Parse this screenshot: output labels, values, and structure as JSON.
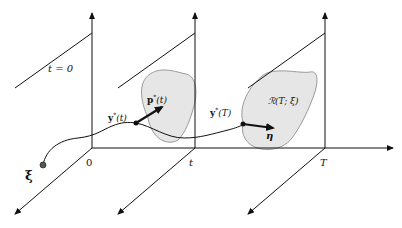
{
  "diagram": {
    "colors": {
      "ink": "#111111",
      "region_fill": "#e6e6e6",
      "region_stroke": "#9a9a9a",
      "dot": "#555555"
    },
    "planes": [
      {
        "id": "t0",
        "label": "t = 0",
        "axis_label": "0"
      },
      {
        "id": "t",
        "axis_label": "t"
      },
      {
        "id": "T",
        "axis_label": "T"
      }
    ],
    "labels": {
      "plane0": "t = 0",
      "axis_0": "0",
      "axis_t": "t",
      "axis_T": "T",
      "initial_state": "ξ",
      "state_t_main": "y",
      "state_t_sup": "*",
      "state_t_arg": "(t)",
      "costate_main": "p",
      "costate_sup": "*",
      "costate_arg": "(t)",
      "state_T_main": "y",
      "state_T_sup": "*",
      "state_T_arg": "(T)",
      "reachable_set": "ℛ(T; ξ)",
      "normal_vector": "η"
    }
  }
}
